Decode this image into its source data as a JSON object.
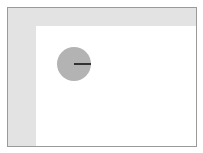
{
  "game": {
    "type": "top-down simulation",
    "colors": {
      "frame_border": "#9a9a9a",
      "margin": "#e3e3e3",
      "playfield": "#ffffff",
      "agent_fill": "#b3b3b3",
      "heading_line": "#333333"
    },
    "agent": {
      "shape": "circle",
      "heading_degrees": 0
    }
  }
}
